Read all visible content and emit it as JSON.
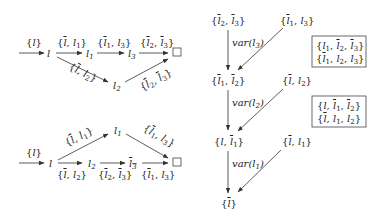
{
  "diagram": {
    "top_left_graph": {
      "nodes": [
        {
          "id": "start_tl",
          "label": ""
        },
        {
          "id": "l",
          "label": "l"
        },
        {
          "id": "l1",
          "label": "l1"
        },
        {
          "id": "l3",
          "label": "l3"
        },
        {
          "id": "l2",
          "label": "l2"
        },
        {
          "id": "end",
          "label": "□"
        }
      ],
      "edges": [
        {
          "from": "start_tl",
          "to": "l",
          "label": "{l}"
        },
        {
          "from": "l",
          "to": "l1",
          "label": "{l̄, l1}"
        },
        {
          "from": "l1",
          "to": "l3",
          "label": "{l̄1, l3}"
        },
        {
          "from": "l3",
          "to": "end",
          "label": "{l̄2, l̄3}"
        },
        {
          "from": "l",
          "to": "l2",
          "label": "{l̄, l2}"
        },
        {
          "from": "l2",
          "to": "end",
          "label": "{l̄2, l̄3}"
        }
      ]
    },
    "bottom_left_graph": {
      "nodes": [
        {
          "id": "start_bl",
          "label": ""
        },
        {
          "id": "l",
          "label": "l"
        },
        {
          "id": "l1",
          "label": "l1"
        },
        {
          "id": "l2",
          "label": "l2"
        },
        {
          "id": "l3bar",
          "label": "l̄3"
        },
        {
          "id": "end",
          "label": "□"
        }
      ],
      "edges": [
        {
          "from": "start_bl",
          "to": "l",
          "label": "{l}"
        },
        {
          "from": "l",
          "to": "l1",
          "label": "{l̄, l1}"
        },
        {
          "from": "l1",
          "to": "end",
          "label": "{l̄1, l3}"
        },
        {
          "from": "l",
          "to": "l2",
          "label": "{l̄, l2}"
        },
        {
          "from": "l2",
          "to": "l3bar",
          "label": "{l̄2, l̄3}"
        },
        {
          "from": "l3bar",
          "to": "end",
          "label": "{l̄1, l3}"
        }
      ]
    },
    "right_graph": {
      "nodes": [
        {
          "id": "a",
          "label": "{l̄2, l̄3}"
        },
        {
          "id": "b",
          "label": "{l̄1, l3}"
        },
        {
          "id": "c",
          "label": "{l̄1, l̄2}"
        },
        {
          "id": "d",
          "label": "{l̄, l2}"
        },
        {
          "id": "e",
          "label": "{l, l̄1}"
        },
        {
          "id": "f",
          "label": "{l̄, l1}"
        },
        {
          "id": "g",
          "label": "{l̄}"
        }
      ],
      "edges": [
        {
          "from": "a",
          "to": "c",
          "label": "var(l3)"
        },
        {
          "from": "b",
          "to": "c",
          "label": ""
        },
        {
          "from": "c",
          "to": "e",
          "label": "var(l2)"
        },
        {
          "from": "d",
          "to": "e",
          "label": ""
        },
        {
          "from": "e",
          "to": "g",
          "label": "var(l1)"
        },
        {
          "from": "f",
          "to": "g",
          "label": ""
        }
      ],
      "boxes": [
        {
          "lines": [
            "{l1, l̄2, l̄3}",
            "{l̄1, l2, l3}"
          ]
        },
        {
          "lines": [
            "{l, l̄1, l̄2}",
            "{l̄, l1, l2}"
          ]
        }
      ]
    }
  }
}
